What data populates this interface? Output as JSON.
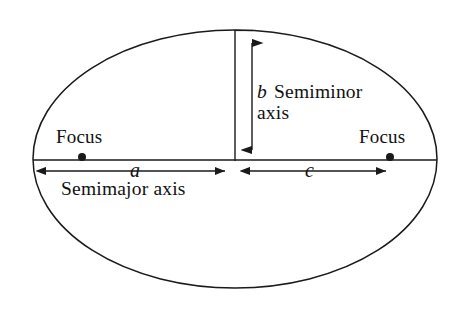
{
  "diagram": {
    "background_color": "#ffffff",
    "stroke_color": "#1a1a1a",
    "labels": {
      "focus_left": "Focus",
      "focus_right": "Focus",
      "semimajor_axis": "Semimajor axis",
      "semiminor_axis_line1": "Semiminor",
      "semiminor_axis_line2": "axis",
      "var_a": "a",
      "var_b": "b",
      "var_c": "c"
    },
    "geometry": {
      "ellipse_center_x": 235,
      "ellipse_center_y": 159,
      "ellipse_radius_x": 202,
      "ellipse_radius_y": 129,
      "major_axis_y": 160,
      "focus_left_x": 82,
      "focus_right_x": 390,
      "focus_dot_y": 157,
      "semiminor_line_x": 235,
      "semiminor_arrow_x": 252,
      "semiminor_top_y": 31,
      "semiminor_bottom_y": 161,
      "dimension_line_y": 171,
      "a_arrow_start_x": 35,
      "a_arrow_end_x": 234,
      "c_arrow_start_x": 240,
      "c_arrow_end_x": 396
    }
  }
}
